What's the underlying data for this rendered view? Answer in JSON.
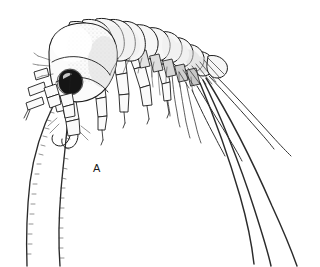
{
  "figure": {
    "domain": "scientific-illustration",
    "panel_label": "A",
    "panel_label_x": 93,
    "panel_label_y": 163,
    "canvas": {
      "width": 320,
      "height": 267,
      "background_color": "#ffffff"
    },
    "style": {
      "technique": "pen-and-ink line drawing with stipple shading",
      "ink_color": "#1c1c1c",
      "eye_color": "#151515",
      "body_fill_color": "#fbfbfb",
      "segment_fill_color": "#f6f6f6",
      "shadow_color": "#d9d9d9"
    },
    "anatomy": {
      "head": {
        "name": "cephalon",
        "note": "large rounded head capsule at left with prominent dark eye"
      },
      "eye": {
        "name": "compound-eye",
        "color": "#151515",
        "shape": "kidney-shaped, dark filled"
      },
      "pereon": {
        "name": "pereon",
        "segments": 7,
        "note": "arched dorsal plates curving up and to the right"
      },
      "pleon": {
        "name": "pleon-urosome",
        "segments": 6,
        "note": "narrowing posterior segments with dense setae"
      },
      "antennae": {
        "name": "antennae",
        "count": 2,
        "note": "two long flagella sweeping down and to the left off the bottom edge"
      },
      "uropods": {
        "name": "uropods-setae",
        "count": 6,
        "note": "long slender rami and setae fanning down and to the right"
      },
      "pereopods": {
        "name": "pereopods",
        "count": 5,
        "note": "segmented walking legs beneath the thorax"
      },
      "gnathopods": {
        "name": "gnathopods",
        "count": 2,
        "note": "hooked grasping appendages below the head"
      }
    }
  }
}
